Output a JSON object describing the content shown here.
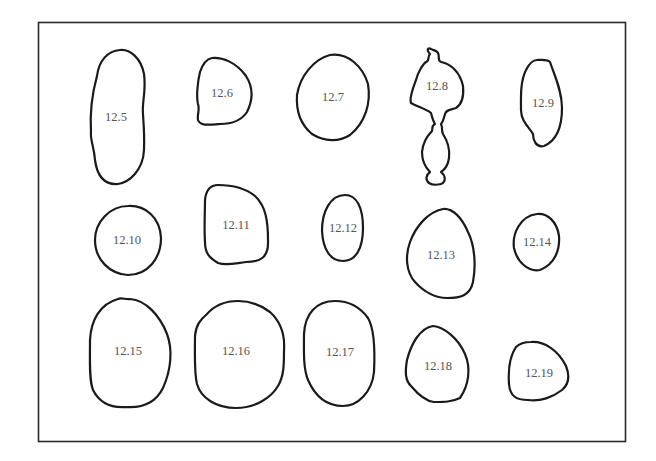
{
  "figure": {
    "frame_color": "#2a2a2a",
    "outline_color": "#1a1a1a",
    "label_color": "#555555",
    "shapes": [
      {
        "id": "12.5",
        "label": "12.5"
      },
      {
        "id": "12.6",
        "label": "12.6"
      },
      {
        "id": "12.7",
        "label": "12.7"
      },
      {
        "id": "12.8",
        "label": "12.8"
      },
      {
        "id": "12.9",
        "label": "12.9"
      },
      {
        "id": "12.10",
        "label": "12.10"
      },
      {
        "id": "12.11",
        "label": "12.11"
      },
      {
        "id": "12.12",
        "label": "12.12"
      },
      {
        "id": "12.13",
        "label": "12.13"
      },
      {
        "id": "12.14",
        "label": "12.14"
      },
      {
        "id": "12.15",
        "label": "12.15"
      },
      {
        "id": "12.16",
        "label": "12.16"
      },
      {
        "id": "12.17",
        "label": "12.17"
      },
      {
        "id": "12.18",
        "label": "12.18"
      },
      {
        "id": "12.19",
        "label": "12.19"
      }
    ]
  }
}
